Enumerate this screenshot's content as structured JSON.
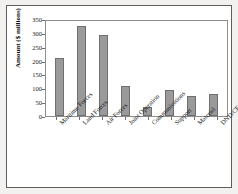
{
  "chart_data": {
    "type": "bar",
    "title": "",
    "xlabel": "",
    "ylabel": "Amount ($ millions)",
    "ylim": [
      0,
      350
    ],
    "ytick_values": [
      0,
      50,
      100,
      150,
      200,
      250,
      300,
      350
    ],
    "ytick_labels": [
      "0",
      "50",
      "100",
      "150",
      "200",
      "250",
      "300",
      "350"
    ],
    "grid": false,
    "legend": false,
    "bar_color": "#9a9a9a",
    "bar_edge_color": "#6f6f6f",
    "categories": [
      "Maritime Forces",
      "Land Forces",
      "Air Forces",
      "Joint Operation",
      "Communications",
      "Support",
      "Materiel",
      "DND/CF"
    ],
    "values": [
      210,
      325,
      292,
      110,
      32,
      93,
      72,
      78
    ]
  }
}
